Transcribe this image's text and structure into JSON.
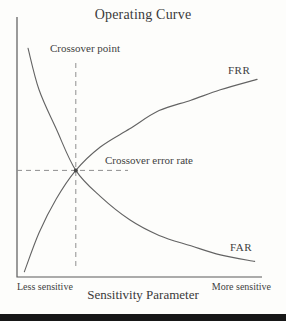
{
  "figure": {
    "title": "Operating Curve",
    "labels": {
      "crossover_point": "Crossover point",
      "crossover_error_rate": "Crossover error rate",
      "frr": "FRR",
      "far": "FAR",
      "less_sensitive": "Less sensitive",
      "more_sensitive": "More sensitive",
      "xlabel": "Sensitivity Parameter"
    },
    "colors": {
      "background": "#fdfdfb",
      "text": "#3f3f3f",
      "curve": "#636363",
      "axis": "#5a5a5a",
      "dashed": "#8f8f8f",
      "dot": "#454545",
      "bottom_bar": "#171717"
    }
  },
  "chart_data": {
    "type": "line",
    "title": "Operating Curve",
    "xlabel": "Sensitivity Parameter",
    "ylabel": "",
    "grid": false,
    "axes_numeric": false,
    "x_axis_range_labels": [
      "Less sensitive",
      "More sensitive"
    ],
    "series": [
      {
        "name": "FRR",
        "description": "False rejection rate rises and saturates as sensitivity increases",
        "x": [
          0.03,
          0.09,
          0.16,
          0.24,
          0.34,
          0.46,
          0.58,
          0.71,
          0.83,
          0.98
        ],
        "y": [
          0.02,
          0.17,
          0.3,
          0.41,
          0.5,
          0.57,
          0.64,
          0.68,
          0.72,
          0.76
        ]
      },
      {
        "name": "FAR",
        "description": "False acceptance rate falls and flattens as sensitivity increases",
        "x": [
          0.045,
          0.09,
          0.16,
          0.24,
          0.34,
          0.46,
          0.58,
          0.71,
          0.83,
          0.97
        ],
        "y": [
          0.88,
          0.72,
          0.57,
          0.41,
          0.31,
          0.22,
          0.16,
          0.12,
          0.085,
          0.06
        ]
      }
    ],
    "annotations": [
      {
        "label": "Crossover point",
        "target": "vertical dashed line at crossover x"
      },
      {
        "label": "Crossover error rate",
        "target": "horizontal dashed line at crossover y"
      }
    ],
    "crossover": {
      "x": 0.24,
      "y": 0.41
    }
  }
}
